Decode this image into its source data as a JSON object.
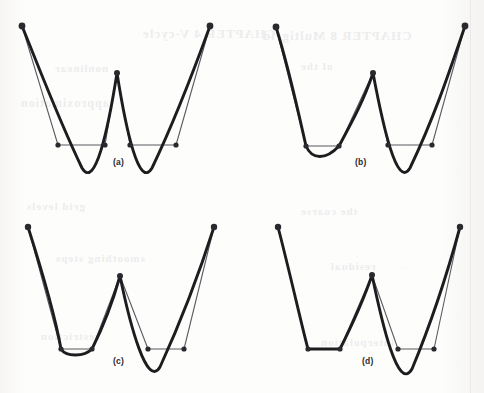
{
  "figure": {
    "kind": "scanned-book-figure",
    "background_color": "#fdfdfc",
    "ink_color": "#1d1d20",
    "thin_line_color": "#5b5b61",
    "vertex_dot_color": "#2a2a2e",
    "panel_count": 4,
    "caption_note": "Four panels labelled (a) through (d)"
  },
  "panels": [
    {
      "label": "(a)",
      "label_x": 113,
      "label_y": 163,
      "origin_x": 0,
      "origin_y": 0,
      "description": "W-shaped smooth curve with chord approximations; both valleys deep and rounded",
      "curve": "M 22 26 C 40 70, 58 118, 82 168 C 95 190, 108 130, 117 73 C 126 130, 139 190, 152 168 C 176 118, 194 70, 210 26",
      "approx_polyline": [
        {
          "x": 22,
          "y": 26
        },
        {
          "x": 58,
          "y": 145
        },
        {
          "x": 105,
          "y": 145
        },
        {
          "x": 117,
          "y": 73
        },
        {
          "x": 130,
          "y": 145
        },
        {
          "x": 176,
          "y": 145
        },
        {
          "x": 210,
          "y": 26
        }
      ],
      "vertices": [
        {
          "x": 22,
          "y": 26,
          "r": 3.4
        },
        {
          "x": 58,
          "y": 145,
          "r": 2.6
        },
        {
          "x": 105,
          "y": 145,
          "r": 2.6
        },
        {
          "x": 117,
          "y": 73,
          "r": 3.0
        },
        {
          "x": 130,
          "y": 145,
          "r": 2.6
        },
        {
          "x": 176,
          "y": 145,
          "r": 2.6
        },
        {
          "x": 210,
          "y": 26,
          "r": 3.4
        }
      ]
    },
    {
      "label": "(b)",
      "label_x": 355,
      "label_y": 163,
      "origin_x": 242,
      "origin_y": 0,
      "description": "Left valley nearly flattened with slight sag; right valley still deep and rounded",
      "curve": "M 34 27 C 48 72, 58 120, 64 146 C 70 160, 84 160, 97 146 C 110 122, 122 100, 131 73 C 141 126, 155 190, 168 168 C 192 118, 208 70, 223 26",
      "approx_polyline": [
        {
          "x": 34,
          "y": 27
        },
        {
          "x": 64,
          "y": 146
        },
        {
          "x": 97,
          "y": 146
        },
        {
          "x": 131,
          "y": 73
        },
        {
          "x": 146,
          "y": 145
        },
        {
          "x": 190,
          "y": 145
        },
        {
          "x": 223,
          "y": 26
        }
      ],
      "vertices": [
        {
          "x": 34,
          "y": 27,
          "r": 3.4
        },
        {
          "x": 64,
          "y": 146,
          "r": 2.6
        },
        {
          "x": 97,
          "y": 146,
          "r": 2.6
        },
        {
          "x": 131,
          "y": 73,
          "r": 3.0
        },
        {
          "x": 146,
          "y": 145,
          "r": 2.6
        },
        {
          "x": 190,
          "y": 145,
          "r": 2.6
        },
        {
          "x": 223,
          "y": 26,
          "r": 3.4
        }
      ]
    },
    {
      "label": "(c)",
      "label_x": 113,
      "label_y": 362,
      "origin_x": 0,
      "origin_y": 197,
      "description": "Left valley essentially flat; right valley deep and rounded",
      "curve": "M 28 30 C 42 74, 56 124, 61 152 C 66 160, 84 160, 92 152 C 104 128, 113 104, 120 79 C 130 128, 147 192, 160 170 C 182 122, 200 74, 214 30",
      "approx_polyline": [
        {
          "x": 28,
          "y": 30
        },
        {
          "x": 61,
          "y": 152
        },
        {
          "x": 92,
          "y": 152
        },
        {
          "x": 120,
          "y": 79
        },
        {
          "x": 148,
          "y": 152
        },
        {
          "x": 184,
          "y": 152
        },
        {
          "x": 214,
          "y": 30
        }
      ],
      "vertices": [
        {
          "x": 28,
          "y": 30,
          "r": 3.2
        },
        {
          "x": 61,
          "y": 152,
          "r": 2.6
        },
        {
          "x": 92,
          "y": 152,
          "r": 2.6
        },
        {
          "x": 120,
          "y": 79,
          "r": 3.0
        },
        {
          "x": 148,
          "y": 152,
          "r": 2.6
        },
        {
          "x": 184,
          "y": 152,
          "r": 2.6
        },
        {
          "x": 214,
          "y": 30,
          "r": 3.2
        }
      ]
    },
    {
      "label": "(d)",
      "label_x": 362,
      "label_y": 362,
      "origin_x": 242,
      "origin_y": 197,
      "description": "Left valley fully straightened into the polyline; right valley remains deep and rounded",
      "curve": "M 36 30 C 48 76, 60 130, 66 152 L 98 152 C 110 128, 122 102, 130 78 C 140 126, 156 196, 170 172 C 190 124, 206 74, 218 30",
      "approx_polyline": [
        {
          "x": 36,
          "y": 30
        },
        {
          "x": 66,
          "y": 152
        },
        {
          "x": 98,
          "y": 152
        },
        {
          "x": 130,
          "y": 78
        },
        {
          "x": 156,
          "y": 152
        },
        {
          "x": 192,
          "y": 152
        },
        {
          "x": 218,
          "y": 30
        }
      ],
      "vertices": [
        {
          "x": 36,
          "y": 30,
          "r": 3.2
        },
        {
          "x": 66,
          "y": 152,
          "r": 2.6
        },
        {
          "x": 98,
          "y": 152,
          "r": 2.6
        },
        {
          "x": 130,
          "y": 78,
          "r": 3.0
        },
        {
          "x": 156,
          "y": 152,
          "r": 2.6
        },
        {
          "x": 192,
          "y": 152,
          "r": 2.6
        },
        {
          "x": 218,
          "y": 30,
          "r": 3.2
        }
      ]
    }
  ],
  "ghost_text": [
    {
      "text": "CHAPTER 4 V-cycle",
      "x": 142,
      "y": 26,
      "size": 13
    },
    {
      "text": "nonlinear",
      "x": 54,
      "y": 62,
      "size": 11
    },
    {
      "text": "CHAPTER 8  Multigrid",
      "x": 262,
      "y": 28,
      "size": 13
    },
    {
      "text": "of the",
      "x": 300,
      "y": 60,
      "size": 11
    },
    {
      "text": "approximation",
      "x": 20,
      "y": 96,
      "size": 12
    },
    {
      "text": "grid levels",
      "x": 26,
      "y": 200,
      "size": 11
    },
    {
      "text": "the coarse",
      "x": 300,
      "y": 205,
      "size": 11
    },
    {
      "text": "smoothing steps",
      "x": 55,
      "y": 252,
      "size": 11
    },
    {
      "text": "residual",
      "x": 330,
      "y": 260,
      "size": 11
    },
    {
      "text": "restriction",
      "x": 40,
      "y": 330,
      "size": 11
    },
    {
      "text": "interpolation",
      "x": 320,
      "y": 336,
      "size": 11
    }
  ]
}
